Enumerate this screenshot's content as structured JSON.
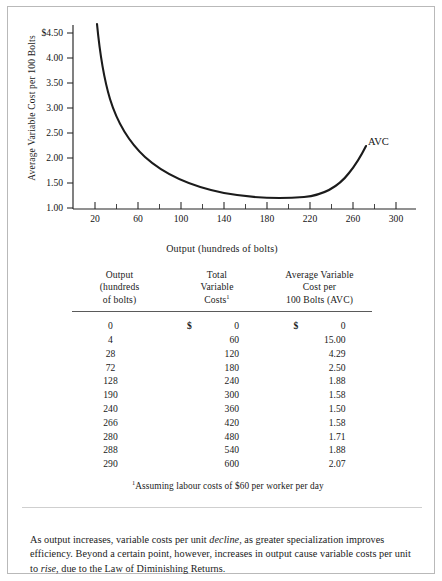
{
  "figure": {
    "chart": {
      "y_axis_title": "Average Variable Cost per 100 Bolts",
      "x_axis_title": "Output (hundreds of bolts)",
      "series_label": "AVC"
    },
    "table": {
      "headers": {
        "col1": [
          "Output",
          "(hundreds",
          "of bolts)"
        ],
        "col2": [
          "Total",
          "Variable",
          "Costs"
        ],
        "col2_footnote_marker": "1",
        "col3": [
          "Average Variable",
          "Cost per",
          "100 Bolts (AVC)"
        ]
      },
      "rows": [
        {
          "output": "0",
          "tvc_symbol": "$",
          "tvc": "0",
          "avc_symbol": "$",
          "avc": "0"
        },
        {
          "output": "4",
          "tvc_symbol": "",
          "tvc": "60",
          "avc_symbol": "",
          "avc": "15.00"
        },
        {
          "output": "28",
          "tvc_symbol": "",
          "tvc": "120",
          "avc_symbol": "",
          "avc": "4.29"
        },
        {
          "output": "72",
          "tvc_symbol": "",
          "tvc": "180",
          "avc_symbol": "",
          "avc": "2.50"
        },
        {
          "output": "128",
          "tvc_symbol": "",
          "tvc": "240",
          "avc_symbol": "",
          "avc": "1.88"
        },
        {
          "output": "190",
          "tvc_symbol": "",
          "tvc": "300",
          "avc_symbol": "",
          "avc": "1.58"
        },
        {
          "output": "240",
          "tvc_symbol": "",
          "tvc": "360",
          "avc_symbol": "",
          "avc": "1.50"
        },
        {
          "output": "266",
          "tvc_symbol": "",
          "tvc": "420",
          "avc_symbol": "",
          "avc": "1.58"
        },
        {
          "output": "280",
          "tvc_symbol": "",
          "tvc": "480",
          "avc_symbol": "",
          "avc": "1.71"
        },
        {
          "output": "288",
          "tvc_symbol": "",
          "tvc": "540",
          "avc_symbol": "",
          "avc": "1.88"
        },
        {
          "output": "290",
          "tvc_symbol": "",
          "tvc": "600",
          "avc_symbol": "",
          "avc": "2.07"
        }
      ]
    },
    "footnote": {
      "marker": "1",
      "text": "Assuming labour costs of $60 per worker per day"
    },
    "caption": {
      "part1": "As output increases, variable costs per unit ",
      "em1": "decline",
      "part2": ", as greater specialization improves efficiency. Beyond a certain point, however, increases in output cause variable costs per unit to ",
      "em2": "rise",
      "part3": ", due to the Law of Diminishing Returns."
    }
  },
  "chart_data": {
    "type": "line",
    "title": "",
    "xlabel": "Output (hundreds of bolts)",
    "ylabel": "Average Variable Cost per 100 Bolts",
    "xlim": [
      0,
      320
    ],
    "ylim": [
      1.0,
      5.0
    ],
    "xticks": [
      20,
      60,
      100,
      140,
      180,
      220,
      260,
      300
    ],
    "xtick_labels": [
      "20",
      "60",
      "100",
      "140",
      "180",
      "220",
      "260",
      "300"
    ],
    "xminor_ticks": [
      40,
      80,
      120,
      160,
      200,
      240,
      280
    ],
    "yticks": [
      1.0,
      1.5,
      2.0,
      2.5,
      3.0,
      3.5,
      4.0,
      4.5
    ],
    "ytick_labels": [
      "1.00",
      "1.50",
      "2.00",
      "2.50",
      "3.00",
      "3.50",
      "4.00",
      "$4.50"
    ],
    "grid": false,
    "legend": "none",
    "annotations": [
      {
        "text": "AVC",
        "x": 296,
        "y": 2.28
      }
    ],
    "series": [
      {
        "name": "AVC",
        "x": [
          4,
          28,
          72,
          128,
          190,
          240,
          266,
          280,
          288,
          290
        ],
        "y": [
          15.0,
          4.29,
          2.5,
          1.88,
          1.58,
          1.5,
          1.58,
          1.71,
          1.88,
          2.07
        ],
        "color": "#1b1b1b"
      }
    ],
    "table": {
      "columns": [
        "Output (hundreds of bolts)",
        "Total Variable Costs",
        "Average Variable Cost per 100 Bolts (AVC)"
      ],
      "rows": [
        [
          0,
          0,
          0
        ],
        [
          4,
          60,
          15.0
        ],
        [
          28,
          120,
          4.29
        ],
        [
          72,
          180,
          2.5
        ],
        [
          128,
          240,
          1.88
        ],
        [
          190,
          300,
          1.58
        ],
        [
          240,
          360,
          1.5
        ],
        [
          266,
          420,
          1.58
        ],
        [
          280,
          480,
          1.71
        ],
        [
          288,
          540,
          1.88
        ],
        [
          290,
          600,
          2.07
        ]
      ]
    }
  }
}
